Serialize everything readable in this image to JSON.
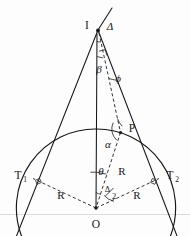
{
  "figure": {
    "points": {
      "apex": "I",
      "origin": "O",
      "tangent_left": "T",
      "tangent_left_sub": "1",
      "tangent_right": "T",
      "tangent_right_sub": "2",
      "circle_point": "P"
    },
    "angles": {
      "delta_apex": "Δ",
      "beta": "β",
      "phi": "ϕ",
      "alpha": "α",
      "theta": "θ",
      "half_delta_num": "Δ",
      "half_delta_den": "2"
    },
    "lengths": {
      "radius_right_upper": "R",
      "radius_left_lower": "R",
      "radius_right_lower": "R"
    },
    "colors": {
      "ink": "#16161a",
      "dash_ink": "#2a2a2e",
      "paper": "#fdfdfd",
      "scanline": "#dcdcdc"
    }
  }
}
